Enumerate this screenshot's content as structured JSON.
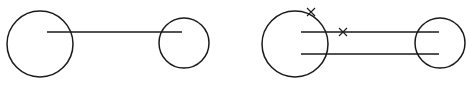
{
  "canvas": {
    "width": 469,
    "height": 89,
    "background": "#ffffff",
    "stroke": "#1a1a1a"
  },
  "figures": [
    {
      "name": "single-line-figure",
      "circles": [
        {
          "cx": 40,
          "cy": 44,
          "r": 33
        },
        {
          "cx": 184,
          "cy": 43,
          "r": 25
        }
      ],
      "lines": [
        {
          "x1": 47,
          "y1": 32,
          "x2": 182,
          "y2": 32
        }
      ],
      "crosses": []
    },
    {
      "name": "double-line-figure",
      "circles": [
        {
          "cx": 295,
          "cy": 44,
          "r": 33
        },
        {
          "cx": 440,
          "cy": 43,
          "r": 25
        }
      ],
      "lines": [
        {
          "x1": 301,
          "y1": 32,
          "x2": 439,
          "y2": 32
        },
        {
          "x1": 301,
          "y1": 54,
          "x2": 439,
          "y2": 54
        }
      ],
      "crosses": [
        {
          "cx": 311,
          "cy": 12,
          "size": 4
        },
        {
          "cx": 343,
          "cy": 32,
          "size": 4
        }
      ]
    }
  ]
}
